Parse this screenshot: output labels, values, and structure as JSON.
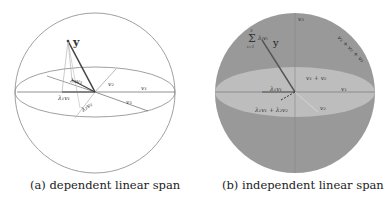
{
  "figure": {
    "panels": [
      {
        "id": "a",
        "caption": "(a) dependent linear span",
        "labels": {
          "y": "y",
          "v1": "v₁",
          "v2": "v₂",
          "v3": "v₃",
          "l1v1": "λ₁v₁",
          "l2v2": "λ₂v₂",
          "l3v3": "λ₃v₃"
        }
      },
      {
        "id": "b",
        "caption": "(b) independent linear span",
        "labels": {
          "y": "y",
          "sum": "Σ λᵢvᵢ",
          "sum_top": "3",
          "sum_bot": "i=1",
          "v1": "v₁",
          "v2": "v₂",
          "v3": "v₃",
          "v1v2": "v₁ + v₂",
          "v1v2v3": "v₁ + v₂ + v₃",
          "l1v1": "λ₁v₁",
          "l12": "λ₁v₁ + λ₂v₂"
        }
      }
    ],
    "colors": {
      "sphere_fill_b": "#999999",
      "ellipse_fill_b": "#bdbdbd",
      "line": "#555555"
    }
  }
}
